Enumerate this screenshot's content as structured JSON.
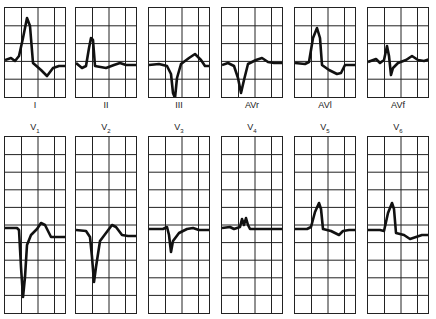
{
  "figure": {
    "colors": {
      "grid": "#222222",
      "trace": "#111111",
      "background": "#ffffff"
    },
    "limb_leads": [
      {
        "id": "I",
        "label": "I",
        "x": 4,
        "trace": "0,52 6,50 10,53 14,48 18,30 22,10 25,18 28,55 36,62 42,68 48,60 54,58 60,58"
      },
      {
        "id": "II",
        "label": "II",
        "x": 75,
        "trace": "0,55 6,60 10,58 13,40 15,30 17,32 19,58 30,60 38,57 44,55 50,57 61,57"
      },
      {
        "id": "III",
        "label": "III",
        "x": 148,
        "trace": "0,57 10,56 18,58 22,66 24,85 26,90 28,70 32,56 40,50 46,46 52,52 56,58 61,58"
      },
      {
        "id": "AVr",
        "label": "AVr",
        "x": 221,
        "trace": "0,57 6,55 12,58 16,70 19,85 22,72 26,56 34,52 40,50 46,54 52,55 62,55"
      },
      {
        "id": "AVl",
        "label": "AVl",
        "x": 294,
        "trace": "0,55 10,56 14,54 18,30 22,20 25,30 27,57 34,62 42,66 46,65 50,57 62,57"
      },
      {
        "id": "AVf",
        "label": "AVf",
        "x": 367,
        "trace": "0,54 8,51 12,55 16,52 19,38 21,48 23,67 25,60 30,55 38,52 44,48 50,52 56,53 62,51"
      }
    ],
    "chest_leads": [
      {
        "id": "V1",
        "label": "V",
        "sub": "1",
        "x": 4,
        "trace": "0,91 12,91 14,93 16,130 18,160 20,140 22,108 26,98 32,92 36,86 40,88 46,100 52,100 60,100"
      },
      {
        "id": "V2",
        "label": "V",
        "sub": "2",
        "x": 75,
        "trace": "0,93 10,94 14,100 16,120 18,145 20,130 24,104 30,96 36,88 40,90 46,98 52,99 62,99"
      },
      {
        "id": "V3",
        "label": "V",
        "sub": "3",
        "x": 148,
        "trace": "0,92 14,92 18,90 20,98 22,115 24,104 30,96 38,92 44,91 50,93 61,93"
      },
      {
        "id": "V4",
        "label": "V",
        "sub": "4",
        "x": 221,
        "trace": "0,91 8,90 12,92 18,90 20,82 22,88 24,81 26,88 28,92 40,92 52,92 62,92"
      },
      {
        "id": "V5",
        "label": "V",
        "sub": "5",
        "x": 294,
        "trace": "0,92 12,92 16,90 20,75 24,66 26,72 28,92 36,94 44,98 48,94 54,93 62,93"
      },
      {
        "id": "V6",
        "label": "V",
        "sub": "6",
        "x": 367,
        "trace": "0,93 12,93 16,94 20,76 24,66 26,72 28,96 36,98 42,102 48,100 54,98 62,98"
      }
    ]
  }
}
